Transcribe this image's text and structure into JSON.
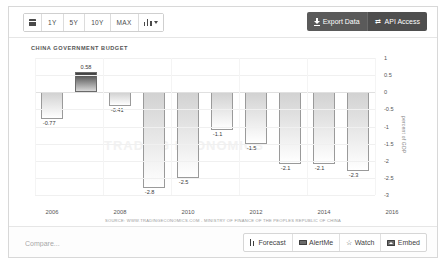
{
  "toolbar": {
    "calendar_icon": "calendar-icon",
    "ranges": [
      "1Y",
      "5Y",
      "10Y",
      "MAX"
    ],
    "chart_type_icon": "bar-chart-icon",
    "export_label": "Export Data",
    "export_icon": "download-icon",
    "api_label": "API Access",
    "api_icon": "transfer-icon"
  },
  "chart": {
    "title": "CHINA GOVERNMENT BUDGET",
    "source": "SOURCE: WWW.TRADINGECONOMICS.COM - MINISTRY OF FINANCE OF THE PEOPLES REPUBLIC OF CHINA",
    "yaxis_title": "percent of GDP"
  },
  "bottom": {
    "compare_placeholder": "Compare...",
    "buttons": [
      {
        "label": "Forecast",
        "icon": "forecast-bars-icon"
      },
      {
        "label": "AlertMe",
        "icon": "envelope-icon"
      },
      {
        "label": "Watch",
        "icon": "star-icon"
      },
      {
        "label": "Embed",
        "icon": "image-icon"
      }
    ]
  },
  "chart_data": {
    "type": "bar",
    "title": "CHINA GOVERNMENT BUDGET",
    "xlabel": "",
    "ylabel": "percent of GDP",
    "ylim": [
      -3,
      1
    ],
    "yticks": [
      1,
      0.5,
      0,
      -0.5,
      -1,
      -1.5,
      -2,
      -2.5,
      -3
    ],
    "ytick_labels": [
      "1",
      "0.5",
      "0",
      "-0.5",
      "-1",
      "-1.5",
      "-2",
      "-2.5",
      "-3"
    ],
    "xtick_labels": [
      "2006",
      "2008",
      "2010",
      "2012",
      "2014",
      "2016"
    ],
    "grid": true,
    "legend": null,
    "categories": [
      "2006",
      "2007",
      "2008",
      "2009",
      "2010",
      "2011",
      "2012",
      "2013",
      "2014",
      "2015"
    ],
    "values": [
      -0.77,
      0.58,
      -0.41,
      -2.8,
      -2.5,
      -1.1,
      -1.5,
      -2.1,
      -2.1,
      -2.3
    ],
    "data_labels": [
      "-0.77",
      "0.58",
      "-0.41",
      "-2.8",
      "-2.5",
      "-1.1",
      "-1.5",
      "-2.1",
      "-2.1",
      "-2.3"
    ]
  }
}
